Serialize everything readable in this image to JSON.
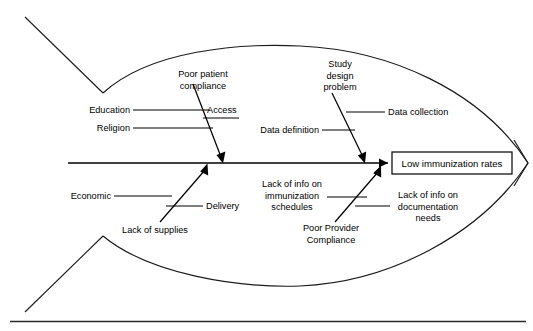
{
  "diagram": {
    "type": "fishbone-ishikawa",
    "effect": {
      "label": "Low immunization rates"
    },
    "causes": {
      "upper_left_branch": {
        "main": "Poor patient compliance",
        "sub": [
          "Education",
          "Access",
          "Religion"
        ]
      },
      "upper_right_branch": {
        "main": "Study design problem",
        "sub": [
          "Data collection",
          "Data definition"
        ]
      },
      "lower_left_branch": {
        "main": "Lack of supplies",
        "sub": [
          "Economic",
          "Delivery"
        ]
      },
      "lower_right_branch": {
        "main": "Poor Provider Compliance",
        "sub": [
          "Lack of info on immunization schedules",
          "Lack of info on documentation needs"
        ]
      }
    },
    "labels": {
      "poor_patient_compliance_line1": "Poor patient",
      "poor_patient_compliance_line2": "compliance",
      "education": "Education",
      "access": "Access",
      "religion": "Religion",
      "study_design_problem_line1": "Study",
      "study_design_problem_line2": "design",
      "study_design_problem_line3": "problem",
      "data_collection": "Data collection",
      "data_definition": "Data definition",
      "economic": "Economic",
      "delivery": "Delivery",
      "lack_of_supplies": "Lack of supplies",
      "lack_info_immunization_line1": "Lack of info on",
      "lack_info_immunization_line2": "immunization",
      "lack_info_immunization_line3": "schedules",
      "poor_provider_compliance_line1": "Poor Provider",
      "poor_provider_compliance_line2": "Compliance",
      "lack_info_documentation_line1": "Lack of info on",
      "lack_info_documentation_line2": "documentation",
      "lack_info_documentation_line3": "needs",
      "effect_box": "Low immunization rates"
    },
    "colors": {
      "stroke": "#000000",
      "body_stroke": "#1a1a1a",
      "background": "#ffffff",
      "text": "#000000",
      "footer_rule": "#2b2b2b"
    }
  }
}
